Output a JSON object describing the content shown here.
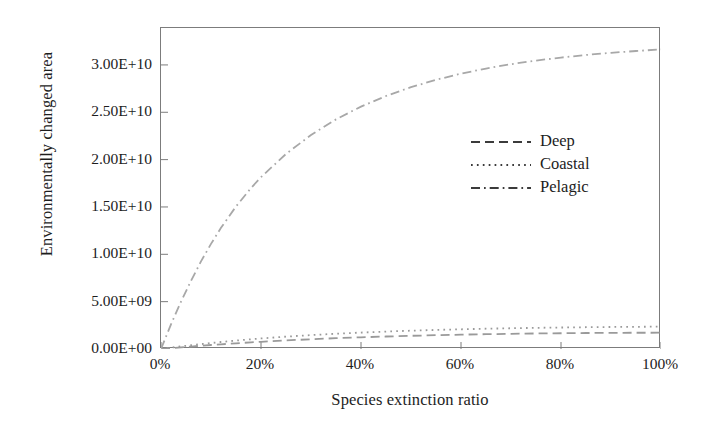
{
  "chart_data": {
    "type": "line",
    "title": "",
    "xlabel": "Species extinction ratio",
    "ylabel": "Environmentally changed area",
    "xlim": [
      0,
      100
    ],
    "ylim": [
      0,
      33900000000
    ],
    "grid": false,
    "legend_position": "center-right",
    "xticks": [
      "0%",
      "20%",
      "40%",
      "60%",
      "80%",
      "100%"
    ],
    "xtick_values": [
      0,
      20,
      40,
      60,
      80,
      100
    ],
    "yticks": [
      "0.00E+00",
      "5.00E+09",
      "1.00E+10",
      "1.50E+10",
      "2.00E+10",
      "2.50E+10",
      "3.00E+10"
    ],
    "ytick_values": [
      0,
      5000000000,
      10000000000,
      15000000000,
      20000000000,
      25000000000,
      30000000000
    ],
    "x": [
      0,
      2,
      4,
      6,
      8,
      10,
      12,
      15,
      18,
      20,
      25,
      30,
      35,
      40,
      45,
      50,
      55,
      60,
      65,
      70,
      75,
      80,
      85,
      90,
      95,
      100
    ],
    "series": [
      {
        "name": "Deep",
        "style": "dashed",
        "color": "#9a9a9a",
        "values": [
          0,
          90000000,
          175000000,
          260000000,
          340000000,
          420000000,
          495000000,
          600000000,
          700000000,
          760000000,
          905000000,
          1030000000,
          1140000000,
          1235000000,
          1320000000,
          1395000000,
          1460000000,
          1515000000,
          1562000000,
          1603000000,
          1638000000,
          1665000000,
          1688000000,
          1705000000,
          1716000000,
          1720000000
        ]
      },
      {
        "name": "Coastal",
        "style": "dotted",
        "color": "#9a9a9a",
        "values": [
          0,
          140000000,
          272000000,
          398000000,
          518000000,
          632000000,
          740000000,
          890000000,
          1028000000,
          1113000000,
          1305000000,
          1470000000,
          1612000000,
          1735000000,
          1842000000,
          1935000000,
          2015000000,
          2083000000,
          2142000000,
          2192000000,
          2234000000,
          2270000000,
          2300000000,
          2325000000,
          2345000000,
          2360000000
        ]
      },
      {
        "name": "Pelagic",
        "style": "dashdot",
        "color": "#a8a8a8",
        "values": [
          0,
          2600000000,
          5000000000,
          7200000000,
          9250000000,
          11100000000,
          12800000000,
          15050000000,
          17000000000,
          18150000000,
          20600000000,
          22600000000,
          24250000000,
          25600000000,
          26720000000,
          27650000000,
          28430000000,
          29080000000,
          29620000000,
          30080000000,
          30460000000,
          30780000000,
          31050000000,
          31280000000,
          31470000000,
          31640000000
        ]
      }
    ]
  },
  "legend": {
    "items": [
      {
        "label": "Deep",
        "style": "dashed"
      },
      {
        "label": "Coastal",
        "style": "dotted"
      },
      {
        "label": "Pelagic",
        "style": "dashdot"
      }
    ]
  },
  "colors": {
    "frame": "#7c7c7c",
    "line": "#9a9a9a",
    "text": "#1d1d1d",
    "background": "#ffffff"
  }
}
